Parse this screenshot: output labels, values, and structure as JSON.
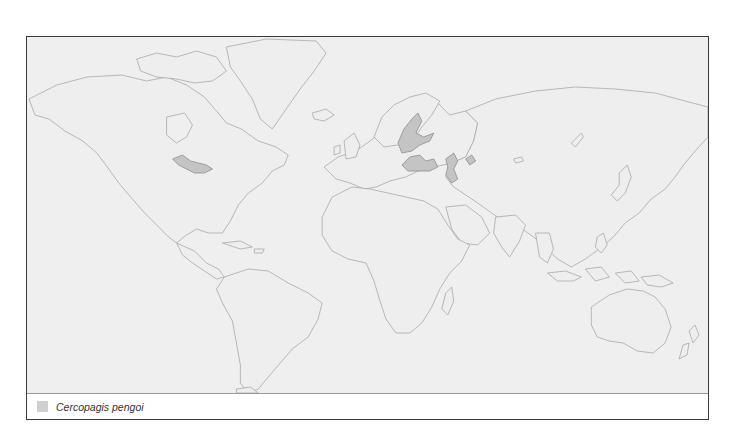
{
  "map": {
    "type": "world distribution map",
    "projection": "equirectangular",
    "background_color": "#efefef",
    "land_color": "#eeeeee",
    "outline_color": "#a8a8a8",
    "highlight_color": "#c4c4c4",
    "highlighted_regions": [
      "Baltic Sea",
      "Gulf of Finland",
      "Black Sea",
      "Sea of Azov",
      "Caspian Sea",
      "Aral Sea",
      "Great Lakes"
    ]
  },
  "legend": {
    "items": [
      {
        "label": "Cercopagis pengoi",
        "color": "#cfcfcf"
      }
    ]
  }
}
